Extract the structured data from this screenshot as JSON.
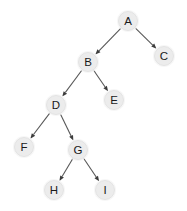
{
  "figure": {
    "name": "binary-tree-diagram",
    "width": 187,
    "height": 211,
    "background_color": "#ffffff",
    "node_fill_color": "#ececec",
    "node_stroke_color": "#e0e0e0",
    "node_label_color": "#1a1a1a",
    "edge_color": "#575757",
    "arrowhead_color": "#3d3d3d",
    "node_radius": 9.5
  },
  "chart_data": {
    "type": "diagram",
    "title": "",
    "nodes": [
      {
        "id": "A",
        "label": "A",
        "x": 128,
        "y": 21
      },
      {
        "id": "B",
        "label": "B",
        "x": 88,
        "y": 62
      },
      {
        "id": "C",
        "label": "C",
        "x": 164,
        "y": 56
      },
      {
        "id": "D",
        "label": "D",
        "x": 56,
        "y": 105
      },
      {
        "id": "E",
        "label": "E",
        "x": 114,
        "y": 100
      },
      {
        "id": "F",
        "label": "F",
        "x": 24,
        "y": 147
      },
      {
        "id": "G",
        "label": "G",
        "x": 78,
        "y": 150
      },
      {
        "id": "H",
        "label": "H",
        "x": 54,
        "y": 190
      },
      {
        "id": "I",
        "label": "I",
        "x": 105,
        "y": 190
      }
    ],
    "edges": [
      {
        "from": "A",
        "to": "B",
        "directed": true
      },
      {
        "from": "A",
        "to": "C",
        "directed": true
      },
      {
        "from": "B",
        "to": "D",
        "directed": true
      },
      {
        "from": "B",
        "to": "E",
        "directed": true
      },
      {
        "from": "D",
        "to": "F",
        "directed": true
      },
      {
        "from": "D",
        "to": "G",
        "directed": true
      },
      {
        "from": "G",
        "to": "H",
        "directed": true
      },
      {
        "from": "G",
        "to": "I",
        "directed": true
      }
    ]
  }
}
